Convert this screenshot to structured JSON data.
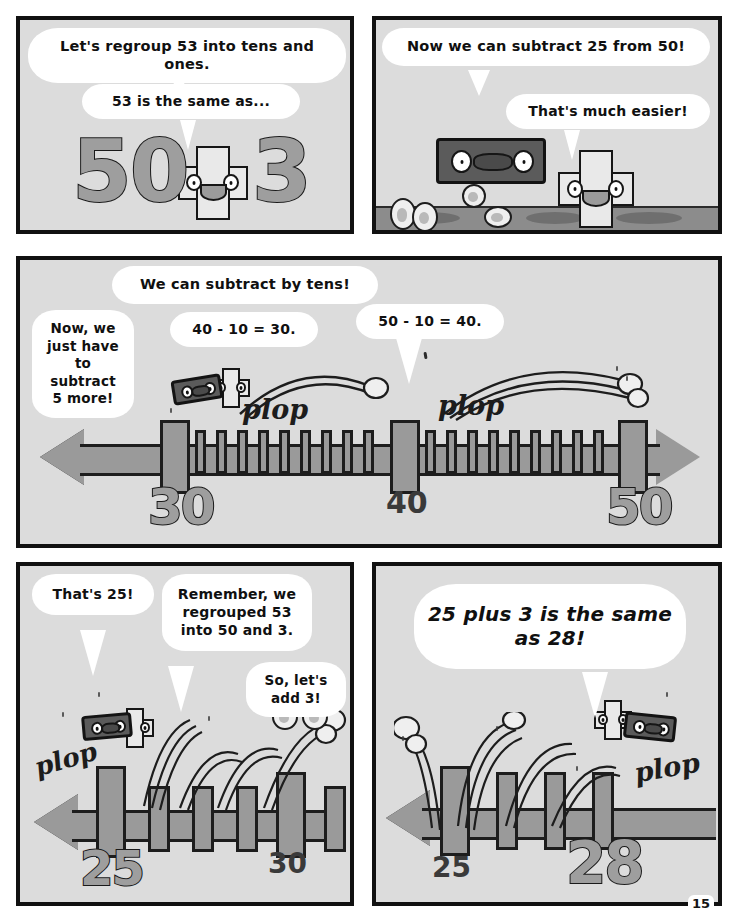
{
  "page": {
    "page_number": "15",
    "background_color": "#ffffff",
    "panel_fill": "#dcdcdc",
    "ink_color": "#111111",
    "gray_numeral_color": "#9e9e9e",
    "rod_character_color": "#5b5b5b"
  },
  "panels": [
    {
      "id": "panel-1",
      "name": "regroup-53-panel",
      "bubbles": [
        {
          "text": "Let's regroup 53 into tens and ones."
        },
        {
          "text": "53 is the same as..."
        }
      ],
      "numerals": [
        {
          "value": "50"
        },
        {
          "value": "3"
        }
      ],
      "characters": [
        {
          "name": "ones-cube-character",
          "expression": "smiling"
        }
      ]
    },
    {
      "id": "panel-2",
      "name": "subtract-25-from-50-panel",
      "bubbles": [
        {
          "text": "Now we can subtract 25 from 50!"
        },
        {
          "text": "That's much easier!"
        }
      ],
      "characters": [
        {
          "name": "tens-rod-character",
          "expression": "smiling"
        },
        {
          "name": "ones-cube-character",
          "expression": "smiling"
        }
      ]
    },
    {
      "id": "panel-3",
      "name": "subtract-by-tens-number-line-panel",
      "bubbles": [
        {
          "text": "We can subtract by tens!"
        },
        {
          "text": "Now, we just have to subtract 5 more!"
        },
        {
          "text": "40 - 10 = 30."
        },
        {
          "text": "50 - 10 = 40."
        }
      ],
      "sound_effects": [
        "plop",
        "plop"
      ],
      "number_line": {
        "labels": [
          "30",
          "40",
          "50"
        ],
        "label_positions": [
          0.22,
          0.5,
          0.79
        ],
        "minor_ticks_per_interval": 10,
        "direction": "bidirectional"
      }
    },
    {
      "id": "panel-4",
      "name": "thats-25-add-3-panel",
      "bubbles": [
        {
          "text": "That's 25!"
        },
        {
          "text": "Remember, we regrouped 53 into 50 and 3."
        },
        {
          "text": "So, let's add 3!"
        }
      ],
      "sound_effects": [
        "plop"
      ],
      "number_line": {
        "labels": [
          "25",
          "30"
        ],
        "direction": "left"
      }
    },
    {
      "id": "panel-5",
      "name": "answer-28-panel",
      "bubbles": [
        {
          "text": "25 plus 3 is the same as 28!"
        }
      ],
      "sound_effects": [
        "plop"
      ],
      "number_line": {
        "labels": [
          "25",
          "28"
        ],
        "direction": "left"
      }
    }
  ],
  "text": {
    "p1_b1": "Let's regroup 53 into tens and ones.",
    "p1_b2": "53 is the same as...",
    "p1_n1": "50",
    "p1_n2": "3",
    "p2_b1": "Now we can subtract 25 from 50!",
    "p2_b2": "That's much easier!",
    "p3_b1": "We can subtract by tens!",
    "p3_b2": "Now, we just have to subtract 5 more!",
    "p3_b3": "40 - 10 = 30.",
    "p3_b4": "50 - 10 = 40.",
    "p3_plop1": "plop",
    "p3_plop2": "plop",
    "p3_n30": "30",
    "p3_n40": "40",
    "p3_n50": "50",
    "p4_b1": "That's 25!",
    "p4_b2": "Remember, we regrouped 53 into 50 and 3.",
    "p4_b3": "So, let's add 3!",
    "p4_plop": "plop",
    "p4_n25": "25",
    "p4_n30": "30",
    "p5_b1": "25 plus 3 is the same as 28!",
    "p5_plop": "plop",
    "p5_n25": "25",
    "p5_n28": "28",
    "page_number": "15"
  }
}
